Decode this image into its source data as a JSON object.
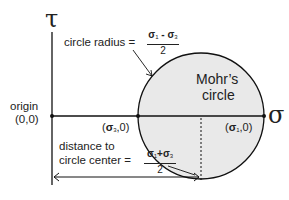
{
  "diagram": {
    "axes": {
      "vertical_label": "τ",
      "horizontal_label": "σ"
    },
    "origin": {
      "label_line1": "origin",
      "label_line2": "(0,0)"
    },
    "circle": {
      "label_line1": "Mohr’s",
      "label_line2": "circle",
      "fill": "#e9e9e9",
      "stroke": "#111111"
    },
    "points": {
      "sigma3": {
        "sym": "σ",
        "sub": "3",
        "rest": ",0)",
        "open": "("
      },
      "sigma1": {
        "sym": "σ",
        "sub": "1",
        "rest": ",0)",
        "open": "("
      }
    },
    "radius_annotation": {
      "label": "circle radius =",
      "num_a": "σ",
      "num_a_sub": "1",
      "op": " - ",
      "num_b": "σ",
      "num_b_sub": "3",
      "den": "2"
    },
    "center_annotation": {
      "label_line1": "distance to",
      "label_line2": "circle center =",
      "num_a": "σ",
      "num_a_sub": "1",
      "op": "+",
      "num_b": "σ",
      "num_b_sub": "3",
      "den": "2"
    }
  }
}
